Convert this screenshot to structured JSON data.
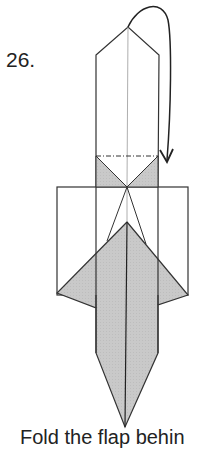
{
  "step": {
    "number": "26.",
    "instruction": "Fold the flap behin"
  },
  "diagram": {
    "fill_color": "#c8c8c8",
    "line_color": "#333333",
    "paper_color": "#ffffff",
    "arrow_type": "fold-behind-arrow",
    "fold_line_type": "mountain-fold-dash-dot"
  }
}
